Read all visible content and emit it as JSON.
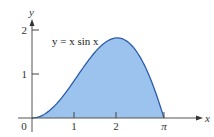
{
  "chart_data": {
    "type": "area",
    "title": "",
    "function": "y = x sin x",
    "annotation": "y = x sin x",
    "xlabel": "x",
    "ylabel": "y",
    "xlim": [
      0,
      4
    ],
    "ylim": [
      0,
      2.2
    ],
    "x_ticks": [
      {
        "value": 0,
        "label": "0"
      },
      {
        "value": 1,
        "label": "1"
      },
      {
        "value": 2,
        "label": "2"
      },
      {
        "value": 3.14159,
        "label": "π"
      }
    ],
    "y_ticks": [
      {
        "value": 1,
        "label": "1"
      },
      {
        "value": 2,
        "label": "2"
      }
    ],
    "x": [
      0,
      0.25,
      0.5,
      0.75,
      1.0,
      1.25,
      1.5,
      1.75,
      2.0,
      2.25,
      2.5,
      2.75,
      3.0,
      3.14159
    ],
    "values": [
      0,
      0.06,
      0.24,
      0.51,
      0.84,
      1.19,
      1.5,
      1.72,
      1.82,
      1.75,
      1.5,
      1.05,
      0.42,
      0
    ],
    "shaded_region": {
      "from": 0,
      "to": 3.14159
    },
    "grid": false,
    "legend": null,
    "colors": {
      "fill": "#9cc3ee",
      "curve": "#2a5da8",
      "axis": "#555555"
    }
  }
}
